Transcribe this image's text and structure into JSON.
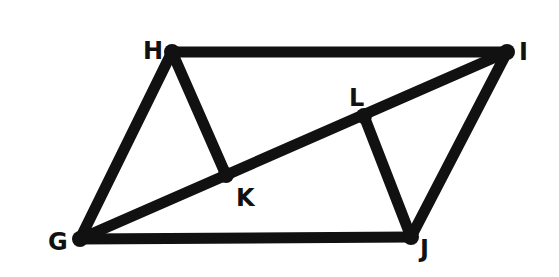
{
  "diagram": {
    "type": "parallelogram-with-diagonal",
    "points": {
      "G": {
        "label": "G",
        "x": 80,
        "y": 239
      },
      "H": {
        "label": "H",
        "x": 172,
        "y": 52
      },
      "I": {
        "label": "I",
        "x": 507,
        "y": 52
      },
      "J": {
        "label": "J",
        "x": 411,
        "y": 237
      },
      "K": {
        "label": "K",
        "x": 226,
        "y": 175
      },
      "L": {
        "label": "L",
        "x": 364,
        "y": 116
      }
    },
    "segments": [
      "GH",
      "HI",
      "IJ",
      "JG",
      "GI",
      "HK",
      "JL"
    ],
    "stroke_color": "#111111"
  }
}
